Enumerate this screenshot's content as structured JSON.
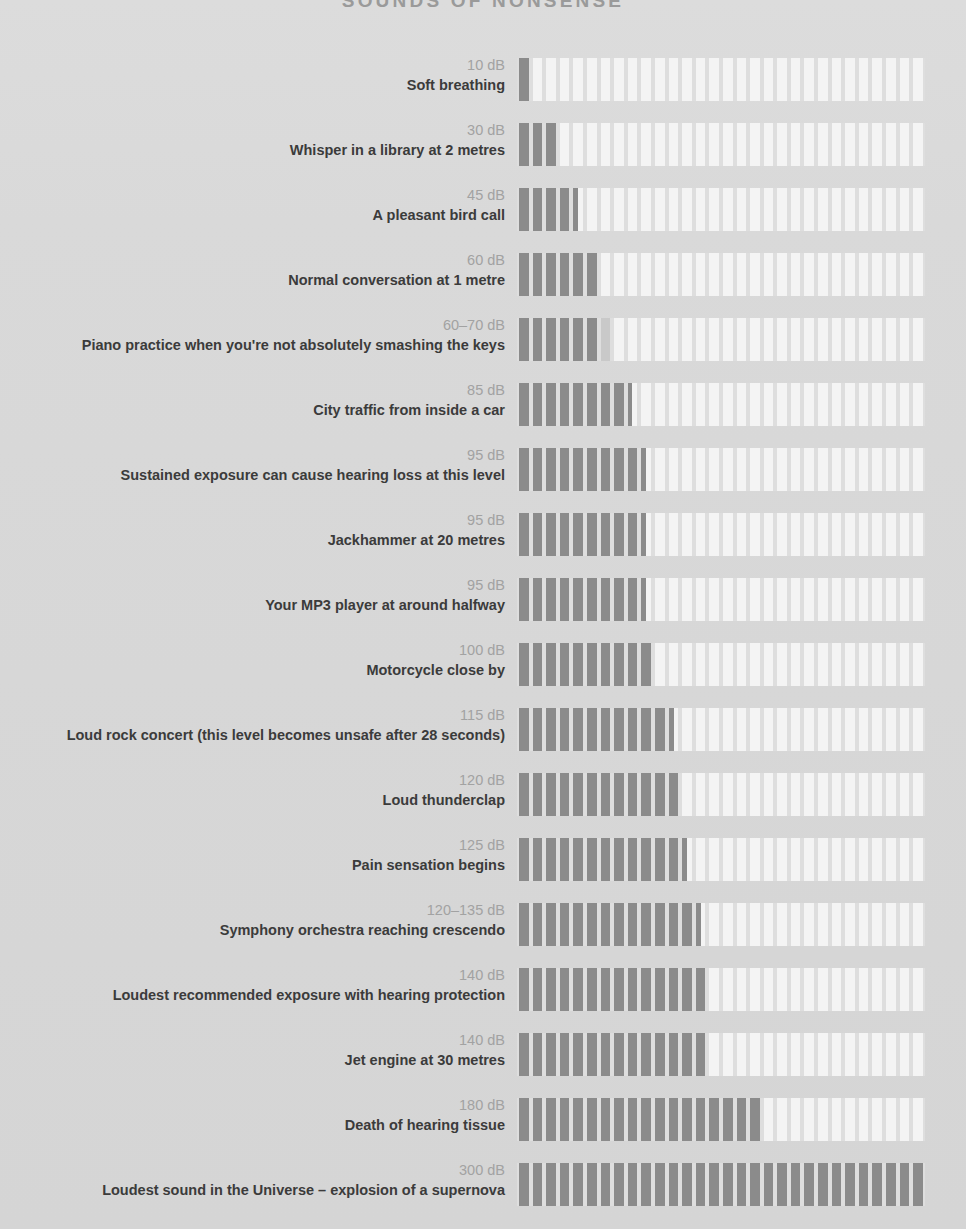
{
  "title": "SOUNDS OF NONSENSE",
  "colors": {
    "background": "#d8d8d8",
    "bar_filled": "#8b8b8b",
    "bar_empty": "#f4f4f4",
    "bar_partial": "#c9c9c9",
    "label_value": "#a2a2a2",
    "label_desc": "#3b3b3b",
    "title": "#9a9a9a"
  },
  "chart_data": {
    "type": "bar",
    "title": "SOUNDS OF NONSENSE",
    "xlabel": "",
    "ylabel": "",
    "orientation": "horizontal",
    "segments_total": 30,
    "db_per_segment": 10,
    "xlim": [
      0,
      300
    ],
    "grid": false,
    "legend": null,
    "categories": [
      "Soft breathing",
      "Whisper in a library at 2 metres",
      "A pleasant bird call",
      "Normal conversation at 1 metre",
      "Piano practice when you're not absolutely smashing the keys",
      "City traffic from inside a car",
      "Sustained exposure can cause hearing loss at this level",
      "Jackhammer at 20 metres",
      "Your MP3 player at around halfway",
      "Motorcycle close by",
      "Loud rock concert (this level becomes unsafe after 28 seconds)",
      "Loud thunderclap",
      "Pain sensation begins",
      "Symphony orchestra reaching crescendo",
      "Loudest recommended exposure with hearing protection",
      "Jet engine at 30 metres",
      "Death of hearing tissue",
      "Loudest sound in the Universe – explosion of a supernova"
    ],
    "values": [
      10,
      30,
      45,
      60,
      70,
      85,
      95,
      95,
      95,
      100,
      115,
      120,
      125,
      135,
      140,
      140,
      180,
      300
    ],
    "value_labels": [
      "10 dB",
      "30 dB",
      "45 dB",
      "60 dB",
      "60–70 dB",
      "85 dB",
      "95 dB",
      "95 dB",
      "95 dB",
      "100 dB",
      "115 dB",
      "120 dB",
      "125 dB",
      "120–135 dB",
      "140 dB",
      "140 dB",
      "180 dB",
      "300 dB"
    ]
  },
  "rows": [
    {
      "value": "10 dB",
      "desc": "Soft breathing",
      "full": 1,
      "partial": 0
    },
    {
      "value": "30 dB",
      "desc": "Whisper in a library at 2 metres",
      "full": 3,
      "partial": 0
    },
    {
      "value": "45 dB",
      "desc": "A pleasant bird call",
      "full": 4,
      "partial": 1
    },
    {
      "value": "60 dB",
      "desc": "Normal conversation at 1 metre",
      "full": 6,
      "partial": 0
    },
    {
      "value": "60–70 dB",
      "desc": "Piano practice when you're not absolutely smashing the keys",
      "full": 6,
      "partial": 2
    },
    {
      "value": "85 dB",
      "desc": "City traffic from inside a car",
      "full": 8,
      "partial": 1
    },
    {
      "value": "95 dB",
      "desc": "Sustained exposure can cause hearing loss at this level",
      "full": 9,
      "partial": 1
    },
    {
      "value": "95 dB",
      "desc": "Jackhammer at 20 metres",
      "full": 9,
      "partial": 1
    },
    {
      "value": "95 dB",
      "desc": "Your MP3 player at around halfway",
      "full": 9,
      "partial": 1
    },
    {
      "value": "100 dB",
      "desc": "Motorcycle close by",
      "full": 10,
      "partial": 0
    },
    {
      "value": "115 dB",
      "desc": "Loud rock concert (this level becomes unsafe after 28 seconds)",
      "full": 11,
      "partial": 1
    },
    {
      "value": "120 dB",
      "desc": "Loud thunderclap",
      "full": 12,
      "partial": 0
    },
    {
      "value": "125 dB",
      "desc": "Pain sensation begins",
      "full": 12,
      "partial": 1
    },
    {
      "value": "120–135 dB",
      "desc": "Symphony orchestra reaching crescendo",
      "full": 13,
      "partial": 1
    },
    {
      "value": "140 dB",
      "desc": "Loudest recommended exposure with hearing protection",
      "full": 14,
      "partial": 0
    },
    {
      "value": "140 dB",
      "desc": "Jet engine at 30 metres",
      "full": 14,
      "partial": 0
    },
    {
      "value": "180 dB",
      "desc": "Death of hearing tissue",
      "full": 18,
      "partial": 0
    },
    {
      "value": "300 dB",
      "desc": "Loudest sound in the Universe – explosion of a supernova",
      "full": 30,
      "partial": 0
    }
  ]
}
